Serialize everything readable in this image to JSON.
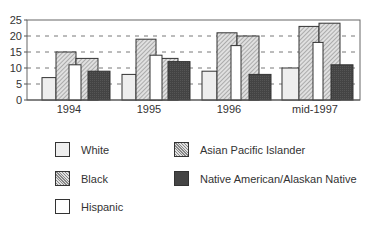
{
  "chart_data": {
    "type": "bar",
    "title": "",
    "xlabel": "",
    "ylabel": "",
    "ylim": [
      0,
      25
    ],
    "yticks": [
      0,
      5,
      10,
      15,
      20,
      25
    ],
    "grid": "horizontal dashed",
    "legend_position": "bottom",
    "categories": [
      "1994",
      "1995",
      "1996",
      "mid-1997"
    ],
    "series": [
      {
        "name": "White",
        "values": [
          7,
          8,
          9,
          10
        ],
        "fill": "light-gray"
      },
      {
        "name": "Black",
        "values": [
          15,
          19,
          21,
          23
        ],
        "fill": "hatched"
      },
      {
        "name": "Hispanic",
        "values": [
          11,
          14,
          17,
          18
        ],
        "fill": "white"
      },
      {
        "name": "Asian Pacific Islander",
        "values": [
          13,
          13,
          20,
          24
        ],
        "fill": "hatched"
      },
      {
        "name": "Native American/Alaskan Native",
        "values": [
          9,
          12,
          8,
          11
        ],
        "fill": "dark"
      }
    ]
  },
  "legend": {
    "items": [
      "White",
      "Black",
      "Hispanic",
      "Asian Pacific Islander",
      "Native American/Alaskan Native"
    ]
  }
}
